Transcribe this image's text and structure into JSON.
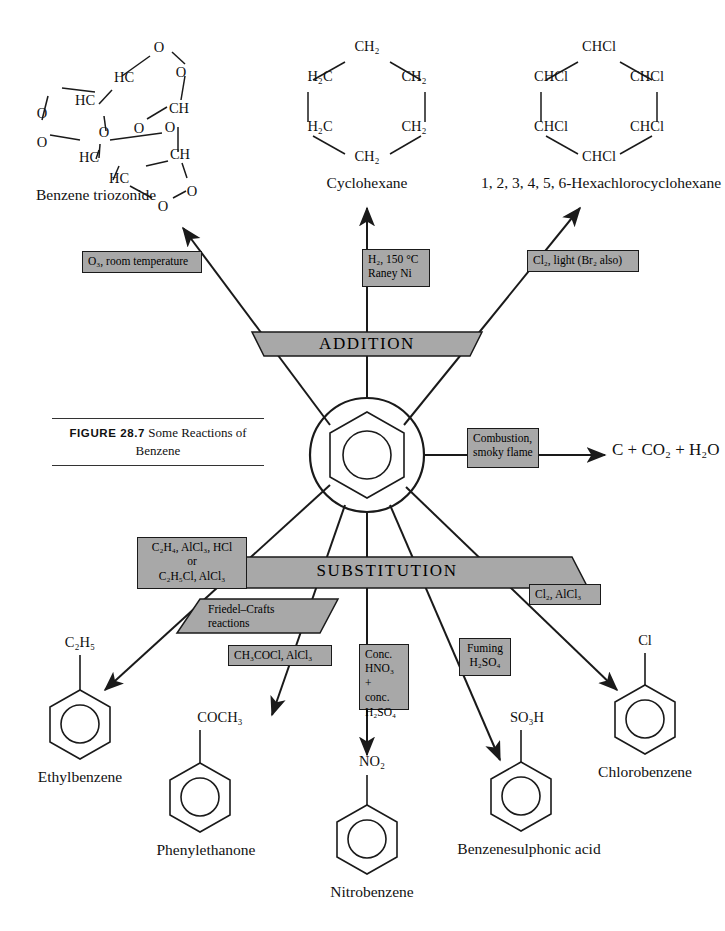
{
  "figure": {
    "number": "FIGURE 28.7",
    "title": "Some Reactions of Benzene",
    "caption_full": "FIGURE 28.7  Some Reactions of Benzene"
  },
  "center": {
    "name": "benzene-hub",
    "description": "Benzene ring drawn as hexagon with inner circle inside an outer circle"
  },
  "banners": {
    "addition": "ADDITION",
    "substitution": "SUBSTITUTION",
    "friedel_crafts_line1": "Friedel–Crafts",
    "friedel_crafts_line2": "reactions"
  },
  "reagents": {
    "ozonolysis": "O₃, room temperature",
    "hydrogenation_line1": "H₂, 150 °C",
    "hydrogenation_line2": "Raney Ni",
    "chlorination_light": "Cl₂, light (Br₂ also)",
    "combustion_line1": "Combustion,",
    "combustion_line2": "smoky flame",
    "alkylation_line1": "C₂H₄, AlCl₃, HCl",
    "alkylation_line2": "or",
    "alkylation_line3": "C₂H₅Cl, AlCl₃",
    "acylation": "CH₃COCl, AlCl₃",
    "nitration_line1": "Conc.",
    "nitration_line2": "HNO₃ +",
    "nitration_line3": "conc.",
    "nitration_line4": "H₂SO₄",
    "sulphonation_line1": "Fuming",
    "sulphonation_line2": "H₂SO₄",
    "halogenation": "Cl₂, AlCl₃"
  },
  "products": {
    "triozonide": {
      "name": "Benzene triozonide",
      "atoms": [
        "O",
        "O",
        "HC",
        "HC",
        "CH",
        "O",
        "O",
        "O",
        "O",
        "HC",
        "HC",
        "CH",
        "O",
        "O"
      ]
    },
    "cyclohexane": {
      "name": "Cyclohexane",
      "vertices": [
        "CH₂",
        "H₂C",
        "H₂C",
        "CH₂",
        "CH₂",
        "CH₂"
      ]
    },
    "hexachlorocyclohexane": {
      "name": "1, 2, 3, 4, 5, 6-Hexachlorocyclohexane",
      "vertices": [
        "CHCl",
        "CHCl",
        "CHCl",
        "CHCl",
        "CHCl",
        "CHCl"
      ]
    },
    "combustion": {
      "name": "C + CO₂ + H₂O"
    },
    "ethylbenzene": {
      "name": "Ethylbenzene",
      "substituent": "C₂H₅"
    },
    "phenylethanone": {
      "name": "Phenylethanone",
      "substituent": "COCH₃"
    },
    "nitrobenzene": {
      "name": "Nitrobenzene",
      "substituent": "NO₂"
    },
    "benzenesulphonic_acid": {
      "name": "Benzenesulphonic acid",
      "substituent": "SO₃H"
    },
    "chlorobenzene": {
      "name": "Chlorobenzene",
      "substituent": "Cl"
    }
  },
  "colors": {
    "banner_fill": "#a8a8a8",
    "line": "#1a1a1a",
    "background": "#ffffff"
  }
}
